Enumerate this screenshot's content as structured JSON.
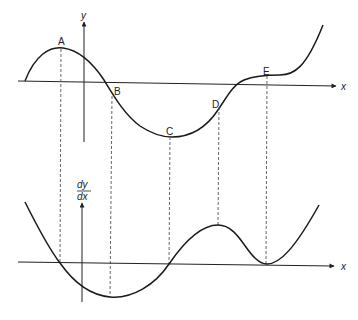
{
  "figure": {
    "colors": {
      "curve": "#1a1a1a",
      "axis": "#222222",
      "dashed": "#555555",
      "background": "#ffffff"
    }
  },
  "top_graph": {
    "y_axis_label": "y",
    "x_axis_label": "x",
    "points": [
      {
        "label": "A",
        "description": "local maximum"
      },
      {
        "label": "B",
        "description": "point of inflection (x-intercept)"
      },
      {
        "label": "C",
        "description": "local minimum"
      },
      {
        "label": "D",
        "description": "point of inflection"
      },
      {
        "label": "E",
        "description": "stationary point of inflection"
      }
    ]
  },
  "bottom_graph": {
    "y_axis_label_numerator": "dy",
    "y_axis_label_denominator": "dx",
    "x_axis_label": "x"
  }
}
